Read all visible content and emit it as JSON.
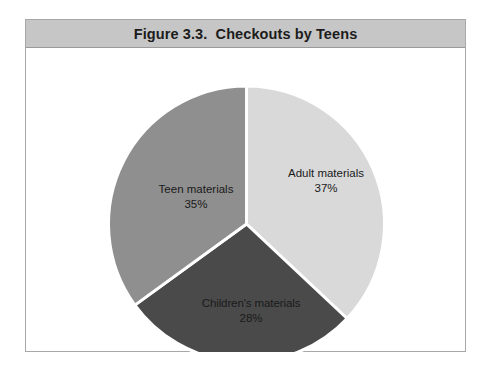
{
  "figure": {
    "caption": "Figure 3.3.  Checkouts by Teens",
    "frame_border_color": "#a8a8a8",
    "caption_bar_color": "#c6c6c6",
    "background_color": "#ffffff"
  },
  "chart_data": {
    "type": "pie",
    "title": "Figure 3.3.  Checkouts by Teens",
    "xlabel": "",
    "ylabel": "",
    "grid": false,
    "legend": "none",
    "labels_position": "inside-slice",
    "start_angle_deg": 0,
    "direction": "clockwise",
    "categories": [
      "Adult materials",
      "Children's materials",
      "Teen materials"
    ],
    "values": [
      37,
      28,
      35
    ],
    "value_unit": "%",
    "slices": [
      {
        "name": "Adult materials",
        "value": 37,
        "label": "Adult materials",
        "percent_text": "37%",
        "color": "#d9d9d9"
      },
      {
        "name": "Children's materials",
        "value": 28,
        "label": "Children's materials",
        "percent_text": "28%",
        "color": "#4a4a4a"
      },
      {
        "name": "Teen materials",
        "value": 35,
        "label": "Teen materials",
        "percent_text": "35%",
        "color": "#8f8f8f"
      }
    ],
    "separator_color": "#ffffff",
    "separator_width_px": 3
  }
}
